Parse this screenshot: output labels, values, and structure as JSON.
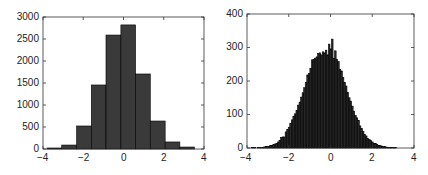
{
  "chart_data": [
    {
      "type": "bar",
      "title": "",
      "xlabel": "",
      "ylabel": "",
      "xlim": [
        -4,
        4
      ],
      "ylim": [
        0,
        3000
      ],
      "grid": false,
      "legend": null,
      "xticks": [
        "-4",
        "-2",
        "0",
        "2",
        "4"
      ],
      "yticks": [
        "0",
        "500",
        "1000",
        "1500",
        "2000",
        "2500",
        "3000"
      ],
      "bin_edges": [
        -3.8,
        -3.07,
        -2.33,
        -1.6,
        -0.87,
        -0.13,
        0.6,
        1.33,
        2.07,
        2.8,
        3.53
      ],
      "values": [
        23,
        90,
        523,
        1455,
        2590,
        2820,
        1705,
        636,
        160,
        45
      ],
      "bar_color": "#3a3a3a",
      "edge_color": "#000000"
    },
    {
      "type": "bar",
      "title": "",
      "xlabel": "",
      "ylabel": "",
      "xlim": [
        -4,
        4
      ],
      "ylim": [
        0,
        400
      ],
      "grid": false,
      "legend": null,
      "xticks": [
        "-4",
        "-2",
        "0",
        "2",
        "4"
      ],
      "yticks": [
        "0",
        "100",
        "200",
        "300",
        "400"
      ],
      "bin_start": -3.8,
      "bin_width": 0.074,
      "values": [
        1,
        1,
        1,
        0,
        1,
        2,
        1,
        2,
        3,
        4,
        5,
        4,
        7,
        8,
        10,
        12,
        14,
        18,
        22,
        31,
        33,
        33,
        48,
        55,
        62,
        74,
        84,
        95,
        102,
        112,
        128,
        137,
        152,
        165,
        180,
        196,
        218,
        222,
        238,
        263,
        265,
        268,
        272,
        282,
        284,
        278,
        287,
        284,
        292,
        278,
        310,
        296,
        325,
        268,
        290,
        265,
        258,
        235,
        230,
        210,
        195,
        185,
        166,
        150,
        140,
        125,
        110,
        97,
        90,
        82,
        66,
        58,
        50,
        40,
        36,
        28,
        26,
        22,
        18,
        14,
        13,
        10,
        8,
        7,
        6,
        4,
        4,
        3,
        2,
        2,
        1,
        1,
        1,
        1,
        0
      ],
      "bar_color": "#2b2b2b",
      "edge_color": "#000000"
    }
  ],
  "left": {
    "yticks": [
      "3000",
      "2500",
      "2000",
      "1500",
      "1000",
      "500",
      "0"
    ],
    "xticks": [
      "−4",
      "−2",
      "0",
      "2",
      "4"
    ]
  },
  "right": {
    "yticks": [
      "400",
      "300",
      "200",
      "100",
      "0"
    ],
    "xticks": [
      "−4",
      "−2",
      "0",
      "2",
      "4"
    ]
  }
}
